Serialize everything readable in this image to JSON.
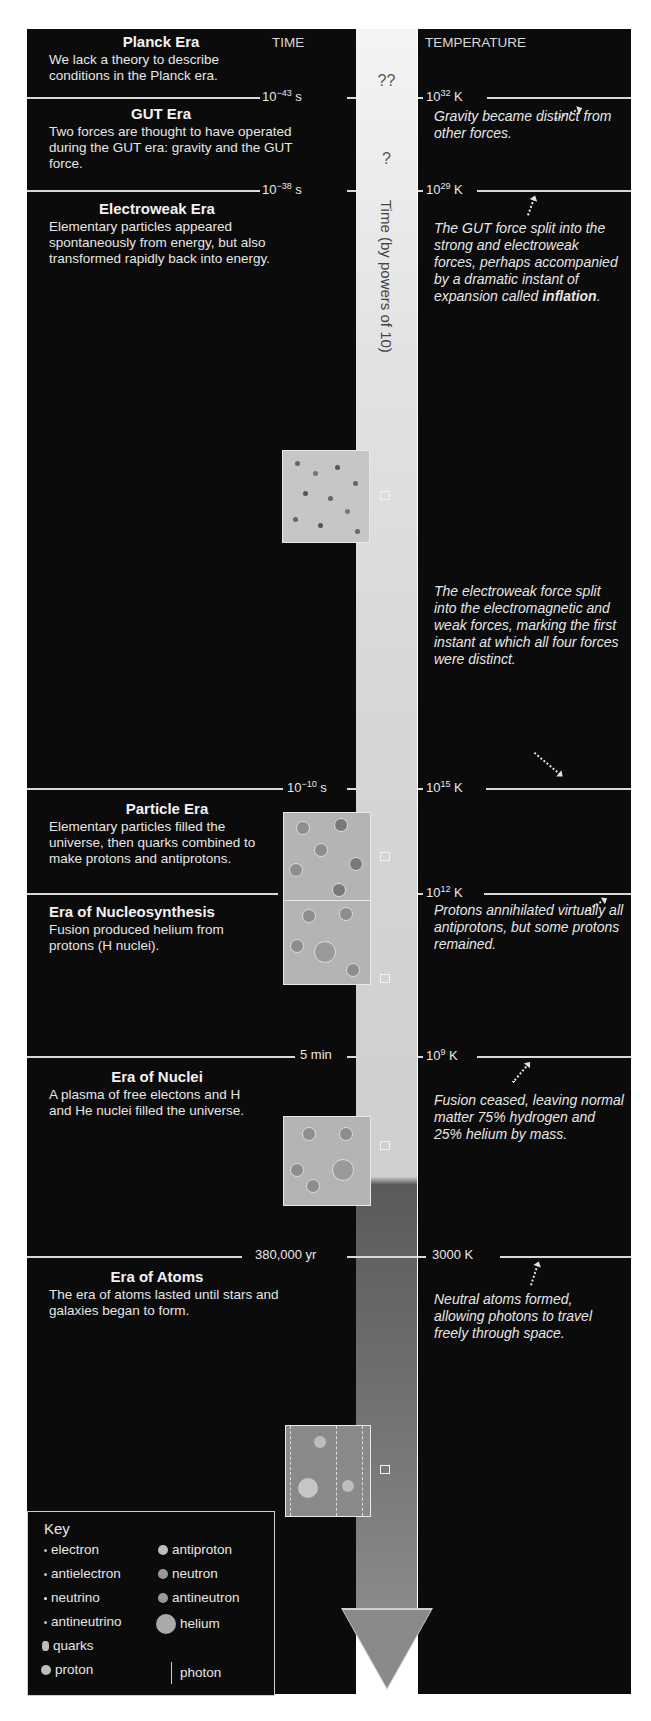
{
  "headers": {
    "time": "TIME",
    "temperature": "TEMPERATURE"
  },
  "axis_label": "Time (by powers of 10)",
  "unknown_markers": {
    "planck": "??",
    "gut": "?"
  },
  "eras": [
    {
      "title": "Planck Era",
      "desc": "We lack a theory to describe conditions in the Planck era."
    },
    {
      "title": "GUT Era",
      "desc": "Two forces are thought to have operated during the GUT era: gravity and the GUT force."
    },
    {
      "title": "Electroweak Era",
      "desc": "Elementary particles appeared spontaneously from energy, but also transformed rapidly back into energy."
    },
    {
      "title": "Particle Era",
      "desc": "Elementary particles filled the universe, then quarks combined to make protons and antiprotons."
    },
    {
      "title": "Era of Nucleosynthesis",
      "desc": "Fusion produced helium from protons (H nuclei)."
    },
    {
      "title": "Era of Nuclei",
      "desc": "A plasma of free electons and H and He nuclei filled the universe."
    },
    {
      "title": "Era of Atoms",
      "desc": "The era of atoms lasted until stars and galaxies began to form."
    }
  ],
  "boundaries": [
    {
      "time_base": "10",
      "time_exp": "−43",
      "time_unit": " s",
      "temp_base": "10",
      "temp_exp": "32",
      "temp_unit": " K"
    },
    {
      "time_base": "10",
      "time_exp": "−38",
      "time_unit": " s",
      "temp_base": "10",
      "temp_exp": "29",
      "temp_unit": " K"
    },
    {
      "time_base": "10",
      "time_exp": "−10",
      "time_unit": " s",
      "temp_base": "10",
      "temp_exp": "15",
      "temp_unit": " K"
    },
    {
      "time_base": "0.001 s",
      "time_exp": "",
      "time_unit": "",
      "temp_base": "10",
      "temp_exp": "12",
      "temp_unit": " K"
    },
    {
      "time_base": "5 min",
      "time_exp": "",
      "time_unit": "",
      "temp_base": "10",
      "temp_exp": "9",
      "temp_unit": " K"
    },
    {
      "time_base": "380,000 yr",
      "time_exp": "",
      "time_unit": "",
      "temp_base": "3000 K",
      "temp_exp": "",
      "temp_unit": ""
    }
  ],
  "notes": {
    "gravity": "Gravity became distinct from other forces.",
    "gut_split_pre": "The GUT force split into the strong and electroweak forces, perhaps accompanied by a dramatic instant of expansion called ",
    "gut_split_bold": "inflation",
    "gut_split_post": ".",
    "electroweak_split": "The electroweak force split into the electromagnetic and weak forces, marking the first instant at which all four forces were distinct.",
    "annihilation": "Protons annihilated virtually all antiprotons, but some protons remained.",
    "fusion_ceased": "Fusion ceased, leaving normal matter 75% hydrogen and 25% helium by mass.",
    "neutral_atoms": "Neutral atoms formed, allowing photons to travel freely through space."
  },
  "key": {
    "title": "Key",
    "items_left": [
      "electron",
      "antielectron",
      "neutrino",
      "antineutrino",
      "quarks",
      "proton"
    ],
    "items_right": [
      "antiproton",
      "neutron",
      "antineutron",
      "helium",
      "photon"
    ]
  },
  "colors": {
    "panel": "#0b0b0b",
    "text": "#e8e8e8",
    "divider": "#d9d9d9",
    "arrow_light": "#f4f4f4",
    "arrow_dark": "#5a5a5a"
  }
}
